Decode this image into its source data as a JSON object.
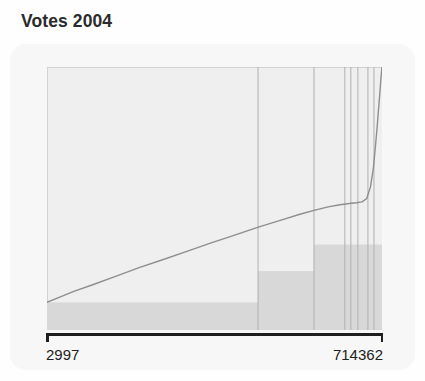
{
  "chart_data": {
    "type": "line",
    "title": "Votes 2004",
    "xlabel": "",
    "ylabel": "",
    "axis_ticks": {
      "left_label": "2997",
      "right_label": "714362"
    },
    "xlim": [
      2997,
      714362
    ],
    "ylim": [
      0,
      1
    ],
    "grid": false,
    "legend": null,
    "series": [
      {
        "name": "Votes 2004 sorted distribution",
        "note": "Monotonically increasing sorted curve, near-linear slow rise then sharp exponential climb at the far right",
        "x": [
          2997,
          30000,
          60000,
          100000,
          150000,
          200000,
          250000,
          300000,
          350000,
          400000,
          450000,
          500000,
          540000,
          570000,
          600000,
          625000,
          645000,
          660000,
          672000,
          682000,
          690000,
          696000,
          700000,
          704000,
          707000,
          710000,
          712000,
          713500,
          714362
        ],
        "y": [
          0.105,
          0.125,
          0.147,
          0.172,
          0.205,
          0.238,
          0.268,
          0.299,
          0.33,
          0.36,
          0.39,
          0.418,
          0.44,
          0.455,
          0.468,
          0.476,
          0.481,
          0.484,
          0.487,
          0.5,
          0.545,
          0.615,
          0.69,
          0.77,
          0.84,
          0.905,
          0.955,
          0.985,
          1.0
        ]
      }
    ],
    "vertical_marker_lines": {
      "color": "#b0b0b0",
      "x_positions": [
        0.63,
        0.797,
        0.889,
        0.907,
        0.928,
        0.958,
        0.976
      ]
    },
    "shaded_band": {
      "color": "#d8d8d8",
      "description": "Stepped gray band rising from the baseline, stepping up at each major vertical marker",
      "steps": [
        {
          "x_start": 0.0,
          "x_end": 0.63,
          "top": 0.105
        },
        {
          "x_start": 0.63,
          "x_end": 0.797,
          "top": 0.224
        },
        {
          "x_start": 0.797,
          "x_end": 1.0,
          "top": 0.325
        }
      ]
    },
    "colors": {
      "plot_background": "#efefef",
      "card_background": "#f7f7f7",
      "curve": "#8e8e8e",
      "band": "#d8d8d8",
      "marker_line": "#b3b3b3",
      "axis": "#1f1f1f",
      "title_text": "#2b2b2b"
    }
  }
}
